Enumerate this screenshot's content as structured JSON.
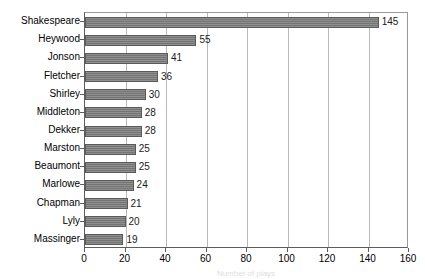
{
  "chart_data": {
    "type": "bar",
    "orientation": "horizontal",
    "title": "",
    "xlabel": "Number of plays",
    "ylabel": "",
    "xlim": [
      0,
      160
    ],
    "xticks": [
      0,
      20,
      40,
      60,
      80,
      100,
      120,
      140,
      160
    ],
    "grid": true,
    "legend": false,
    "categories": [
      "Shakespeare",
      "Heywood",
      "Jonson",
      "Fletcher",
      "Shirley",
      "Middleton",
      "Dekker",
      "Marston",
      "Beaumont",
      "Marlowe",
      "Chapman",
      "Lyly",
      "Massinger"
    ],
    "values": [
      145,
      55,
      41,
      36,
      30,
      28,
      28,
      25,
      25,
      24,
      21,
      20,
      19
    ],
    "value_labels": [
      "145",
      "55",
      "41",
      "36",
      "30",
      "28",
      "28",
      "25",
      "25",
      "24",
      "21",
      "20",
      "19"
    ],
    "colors": {
      "bar_fill": "#7a7a7a",
      "bar_edge": "#5a5a5a",
      "gridline": "#b9b9b9",
      "axis": "#5d5d5d",
      "text": "#000000",
      "background": "#ffffff"
    }
  }
}
